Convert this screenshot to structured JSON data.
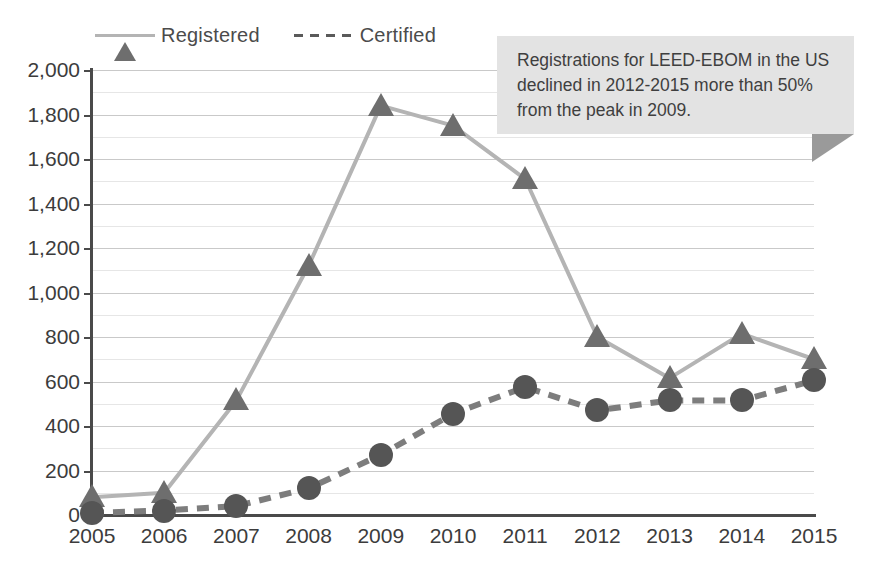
{
  "chart_data": {
    "type": "line",
    "title": "",
    "subtitle": "",
    "xlabel": "",
    "ylabel": "",
    "categories": [
      "2005",
      "2006",
      "2007",
      "2008",
      "2009",
      "2010",
      "2011",
      "2012",
      "2013",
      "2014",
      "2015"
    ],
    "series": [
      {
        "name": "Registered",
        "marker": "triangle",
        "linestyle": "solid",
        "color": "#b4b4b4",
        "marker_color": "#6e6e6e",
        "values": [
          80,
          100,
          515,
          1120,
          1840,
          1750,
          1510,
          800,
          615,
          815,
          700
        ]
      },
      {
        "name": "Certified",
        "marker": "circle",
        "linestyle": "dashed",
        "color": "#7d7d7d",
        "marker_color": "#555555",
        "values": [
          10,
          20,
          40,
          120,
          270,
          455,
          575,
          470,
          515,
          515,
          605
        ]
      }
    ],
    "ylim": [
      0,
      2000
    ],
    "ytick_values": [
      0,
      200,
      400,
      600,
      800,
      1000,
      1200,
      1400,
      1600,
      1800,
      2000
    ],
    "ytick_labels": [
      "0",
      "200",
      "400",
      "600",
      "800",
      "1,000",
      "1,200",
      "1,400",
      "1,600",
      "1,800",
      "2,000"
    ],
    "minor_gridline_step": 100,
    "grid": true,
    "legend_position": "top-left"
  },
  "legend": {
    "items": [
      {
        "label": "Registered",
        "icon": "triangle-marker-icon",
        "line": "solid"
      },
      {
        "label": "Certified",
        "icon": "circle-marker-icon",
        "line": "dashed"
      }
    ]
  },
  "callout": {
    "text": "Registrations for LEED-EBOM in the US declined in 2012-2015 more than 50% from the peak in 2009.",
    "background": "#e3e3e3",
    "tail_color": "#9a9a9a"
  },
  "colors": {
    "registered_line": "#b4b4b4",
    "registered_marker": "#6e6e6e",
    "certified_line": "#7d7d7d",
    "certified_marker": "#555555",
    "axis": "#4a4a4a",
    "major_grid": "#c9c9c9",
    "minor_grid": "#e6e6e6",
    "text": "#3c3c3c",
    "background": "#ffffff"
  }
}
